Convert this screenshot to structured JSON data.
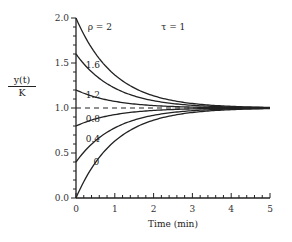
{
  "chart_data": {
    "type": "line",
    "title": "",
    "xlabel": "Time (min)",
    "ylabel_numerator": "y(t)",
    "ylabel_denominator": "K",
    "xlim": [
      0,
      5
    ],
    "ylim": [
      0,
      2.0
    ],
    "x_ticks": [
      "0",
      "1",
      "2",
      "3",
      "4",
      "5"
    ],
    "y_ticks": [
      "0.0",
      "0.5",
      "1.0",
      "1.5",
      "2.0"
    ],
    "annotations": [
      {
        "text": "ρ = 2",
        "x": 0.3,
        "y": 1.9
      },
      {
        "text": "τ = 1",
        "x": 2.2,
        "y": 1.9
      }
    ],
    "reference_line": {
      "y": 1.0,
      "style": "dashed"
    },
    "formula": "y(t)/K = 1 + (ρ - 1) exp(-t/τ)",
    "tau": 1,
    "x": [
      0,
      0.5,
      1,
      1.5,
      2,
      2.5,
      3,
      3.5,
      4,
      4.5,
      5
    ],
    "series": [
      {
        "name": "2",
        "label": "ρ = 2",
        "values": [
          2.0,
          1.607,
          1.368,
          1.223,
          1.135,
          1.082,
          1.05,
          1.03,
          1.018,
          1.011,
          1.007
        ]
      },
      {
        "name": "1.6",
        "label": "1.6",
        "values": [
          1.6,
          1.364,
          1.221,
          1.134,
          1.081,
          1.049,
          1.03,
          1.018,
          1.011,
          1.007,
          1.004
        ]
      },
      {
        "name": "1.2",
        "label": "1.2",
        "values": [
          1.2,
          1.121,
          1.074,
          1.045,
          1.027,
          1.016,
          1.01,
          1.006,
          1.004,
          1.002,
          1.001
        ]
      },
      {
        "name": "0.8",
        "label": "0.8",
        "values": [
          0.8,
          0.879,
          0.926,
          0.955,
          0.973,
          0.984,
          0.99,
          0.994,
          0.996,
          0.998,
          0.999
        ]
      },
      {
        "name": "0.4",
        "label": "0.4",
        "values": [
          0.4,
          0.636,
          0.779,
          0.866,
          0.919,
          0.951,
          0.97,
          0.982,
          0.989,
          0.993,
          0.996
        ]
      },
      {
        "name": "0",
        "label": "0",
        "values": [
          0.0,
          0.393,
          0.632,
          0.777,
          0.865,
          0.918,
          0.95,
          0.97,
          0.982,
          0.989,
          0.993
        ]
      }
    ],
    "curve_labels": [
      {
        "text": "1.6",
        "x": 0.25,
        "y": 1.48
      },
      {
        "text": "1.2",
        "x": 0.25,
        "y": 1.15
      },
      {
        "text": "0.8",
        "x": 0.25,
        "y": 0.88
      },
      {
        "text": "0.4",
        "x": 0.25,
        "y": 0.66
      },
      {
        "text": "0",
        "x": 0.45,
        "y": 0.4
      }
    ],
    "grid": false,
    "legend": "none"
  }
}
